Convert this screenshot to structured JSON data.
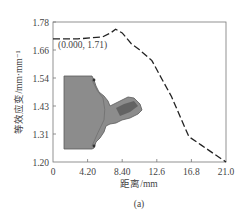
{
  "chart_data": {
    "type": "line",
    "title": "",
    "xlabel": "距离/mm",
    "ylabel": "等效应变/mm·mm⁻¹",
    "caption": "(a)",
    "xlim": [
      0,
      21.0
    ],
    "ylim": [
      1.2,
      1.78
    ],
    "x_ticks": [
      "0",
      "4.20",
      "8.40",
      "12.6",
      "16.8",
      "21.0"
    ],
    "y_ticks": [
      "1.20",
      "1.31",
      "1.43",
      "1.54",
      "1.66",
      "1.78"
    ],
    "grid": false,
    "legend": null,
    "series": [
      {
        "name": "equivalent-strain",
        "style": "dashed",
        "color": "#222222",
        "x": [
          0.0,
          3.0,
          6.0,
          7.0,
          7.6,
          8.4,
          9.5,
          10.5,
          12.0,
          13.2,
          14.4,
          15.6,
          16.5,
          18.0,
          19.5,
          21.0
        ],
        "y": [
          1.71,
          1.71,
          1.718,
          1.735,
          1.75,
          1.735,
          1.69,
          1.665,
          1.62,
          1.545,
          1.47,
          1.375,
          1.305,
          1.27,
          1.235,
          1.2
        ]
      }
    ],
    "annotations": [
      {
        "text": "(0.000, 1.71)",
        "x": 0.0,
        "y": 1.71
      }
    ],
    "inset": {
      "description": "gray cross-section micrograph of sample",
      "color": "#8a8a8a"
    }
  }
}
